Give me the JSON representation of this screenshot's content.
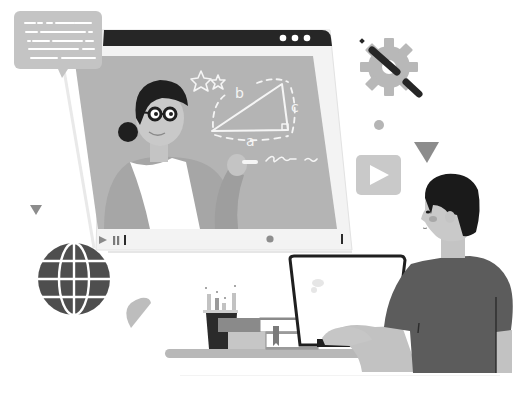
{
  "illustration": {
    "subject": "Online learning: teacher on video lesson, student at laptop",
    "palette": {
      "background": "#ffffff",
      "board": "#b3b3b3",
      "window_frame": "#f2f2f2",
      "title_bar": "#262626",
      "dark": "#2b2b2b",
      "mid": "#7a7a7a",
      "light": "#c8c8c8",
      "chalk": "#f5f5f5",
      "skin": "#cfcfcf",
      "shirt": "#5e5e5e"
    }
  },
  "video_window": {
    "title_bar_dots": 3,
    "board": {
      "triangle_labels": {
        "a": "a",
        "b": "b",
        "c": "c"
      },
      "stars": 2,
      "scribble": "~~"
    },
    "controls": {
      "play_icon": "play-icon",
      "pause_icon": "pause-icon",
      "progress_dot": "progress-dot",
      "end_marker": "end-marker"
    }
  },
  "chat_bubble": {
    "lines": 5
  },
  "decorations": {
    "icons": [
      "gear-icon",
      "pencil-icon",
      "play-button-icon",
      "globe-icon",
      "triangle-shape",
      "circle-shape",
      "half-circle-shape"
    ]
  },
  "student_desk": {
    "items": [
      "laptop",
      "pencil-cup",
      "book-stack"
    ]
  },
  "caption": "Online education illustration"
}
